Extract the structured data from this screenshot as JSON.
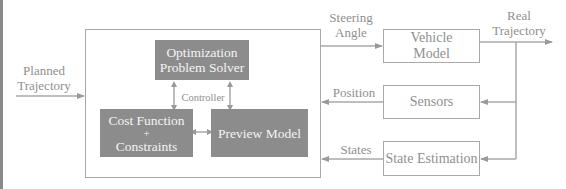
{
  "diagram": {
    "controller": {
      "label": "Controller",
      "solver": {
        "line1": "Optimization",
        "line2": "Problem Solver"
      },
      "cost": {
        "line1": "Cost Function",
        "line2": "+",
        "line3": "Constraints"
      },
      "preview": {
        "label": "Preview Model"
      }
    },
    "inputs": {
      "planned_line1": "Planned",
      "planned_line2": "Trajectory"
    },
    "signals": {
      "steering_line1": "Steering",
      "steering_line2": "Angle",
      "real_line1": "Real",
      "real_line2": "Trajectory",
      "position": "Position",
      "states": "States"
    },
    "blocks": {
      "vehicle_line1": "Vehicle",
      "vehicle_line2": "Model",
      "sensors": "Sensors",
      "state_estimation": "State Estimation"
    },
    "colors": {
      "dark_box": "#8c8c8c",
      "line": "#a9a9a9",
      "text": "#8f8f8f"
    }
  }
}
